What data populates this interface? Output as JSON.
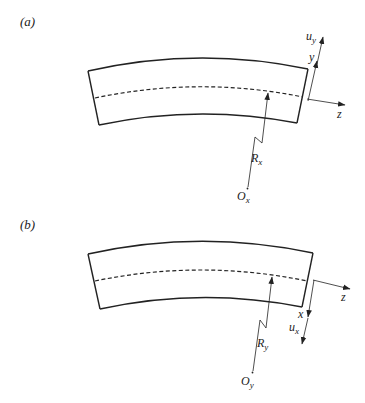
{
  "colors": {
    "stroke": "#222222",
    "background": "#ffffff"
  },
  "panels": [
    {
      "id": "a",
      "label": "(a)",
      "radius_label": {
        "main": "R",
        "sub": "x"
      },
      "origin_label": {
        "main": "O",
        "sub": "x"
      },
      "axes": [
        {
          "name": "z",
          "label": "z",
          "direction": "right"
        },
        {
          "name": "y",
          "label": "y",
          "direction": "up"
        },
        {
          "name": "u_y",
          "label": {
            "main": "u",
            "sub": "y"
          },
          "direction": "up"
        }
      ]
    },
    {
      "id": "b",
      "label": "(b)",
      "radius_label": {
        "main": "R",
        "sub": "y"
      },
      "origin_label": {
        "main": "O",
        "sub": "y"
      },
      "axes": [
        {
          "name": "z",
          "label": "z",
          "direction": "right"
        },
        {
          "name": "x",
          "label": "x",
          "direction": "down"
        },
        {
          "name": "u_x",
          "label": {
            "main": "u",
            "sub": "x"
          },
          "direction": "down"
        }
      ]
    }
  ]
}
